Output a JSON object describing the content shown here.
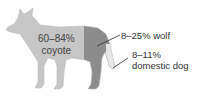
{
  "diagram": {
    "segments": [
      {
        "id": "coyote",
        "label_line1": "60–84%",
        "label_line2": "coyote",
        "color": "#c6c6c6"
      },
      {
        "id": "wolf",
        "label": "8–25% wolf",
        "color": "#8c8c8c"
      },
      {
        "id": "dog",
        "label_line1": "8–11%",
        "label_line2": "domestic dog",
        "color": "#e6e6e6"
      }
    ],
    "leader_color": "#333333"
  }
}
